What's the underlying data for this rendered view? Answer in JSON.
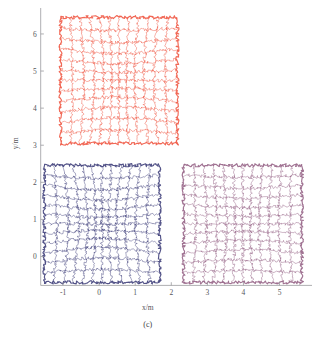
{
  "figure": {
    "caption": "(c)",
    "background_color": "#ffffff"
  },
  "axes": {
    "xlabel": "x/m",
    "ylabel": "y/m",
    "xticks": [
      "-1",
      "0",
      "1",
      "2",
      "3",
      "4",
      "5"
    ],
    "yticks": [
      "0",
      "1",
      "2",
      "3",
      "4",
      "5",
      "6"
    ],
    "xlim": [
      -1.75,
      5.9
    ],
    "ylim": [
      -0.85,
      6.7
    ],
    "tick_color": "#9a9a9e",
    "label_color": "#55555a",
    "grid": false,
    "spines": [
      "left",
      "bottom"
    ]
  },
  "chart_data": {
    "type": "line",
    "title": "",
    "subtitle": "",
    "xlabel": "x/m",
    "ylabel": "y/m",
    "xlim": [
      -1.75,
      5.9
    ],
    "ylim": [
      -0.85,
      6.7
    ],
    "grid": false,
    "legend": "none",
    "series": [
      {
        "name": "mesh-red",
        "color": "#f0604d",
        "nx": 13,
        "ny": 13,
        "center": [
          0.55,
          4.75
        ],
        "half_width": 1.62,
        "half_height": 1.7,
        "pincushion": 0.3,
        "corners": [
          [
            -1.07,
            3.05
          ],
          [
            2.17,
            3.05
          ],
          [
            2.17,
            6.45
          ],
          [
            -1.07,
            6.45
          ]
        ],
        "values": [
          3.05,
          6.45,
          -1.07,
          2.17
        ]
      },
      {
        "name": "mesh-blue",
        "color": "#4a4a82",
        "nx": 13,
        "ny": 13,
        "center": [
          0.08,
          0.88
        ],
        "half_width": 1.6,
        "half_height": 1.58,
        "pincushion": 0.4,
        "corners": [
          [
            -1.52,
            -0.7
          ],
          [
            1.68,
            -0.7
          ],
          [
            1.68,
            2.46
          ],
          [
            -1.52,
            2.46
          ]
        ],
        "values": [
          -0.7,
          2.46,
          -1.52,
          1.68
        ]
      },
      {
        "name": "mesh-purple",
        "color": "#9b6a8c",
        "nx": 13,
        "ny": 13,
        "center": [
          3.98,
          0.88
        ],
        "half_width": 1.64,
        "half_height": 1.58,
        "pincushion": 0.26,
        "corners": [
          [
            2.34,
            -0.7
          ],
          [
            5.62,
            -0.7
          ],
          [
            5.62,
            2.46
          ],
          [
            2.34,
            2.46
          ]
        ],
        "values": [
          -0.7,
          2.46,
          2.34,
          5.62
        ]
      }
    ]
  }
}
